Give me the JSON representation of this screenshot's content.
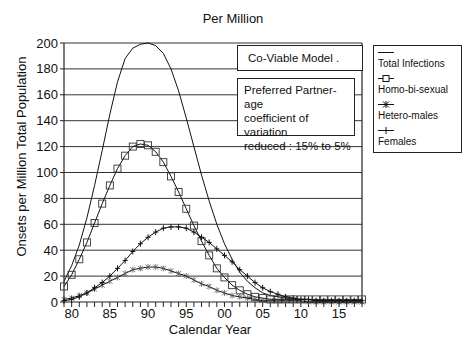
{
  "chart": {
    "title": "Per Million",
    "ylabel": "Onsets per Million Total Population",
    "xlabel": "Calendar Year",
    "notes": {
      "model": "Co-Viable Model .",
      "line1": "Preferred Partner-age",
      "line2": "coefficient of variation",
      "line3": "reduced  : 15% to 5%"
    },
    "legend": [
      {
        "label": "Total Infections",
        "marker": "none"
      },
      {
        "label": "Homo-bi-sexual",
        "marker": "square"
      },
      {
        "label": "Hetero-males",
        "marker": "asterisk"
      },
      {
        "label": "Females",
        "marker": "plus"
      }
    ],
    "yticks": [
      "0",
      "20",
      "40",
      "60",
      "80",
      "100",
      "120",
      "140",
      "160",
      "180",
      "200"
    ],
    "xticks": [
      "80",
      "85",
      "90",
      "95",
      "00",
      "05",
      "10",
      "15"
    ]
  },
  "chart_data": {
    "type": "line",
    "title": "Per Million",
    "xlabel": "Calendar Year",
    "ylabel": "Onsets per Million Total Population",
    "xlim": [
      1979,
      2018
    ],
    "ylim": [
      0,
      200
    ],
    "grid": "horizontal",
    "legend_position": "right-outside",
    "x": [
      1979,
      1980,
      1981,
      1982,
      1983,
      1984,
      1985,
      1986,
      1987,
      1988,
      1989,
      1990,
      1991,
      1992,
      1993,
      1994,
      1995,
      1996,
      1997,
      1998,
      1999,
      2000,
      2001,
      2002,
      2003,
      2004,
      2005,
      2006,
      2007,
      2008,
      2009,
      2010,
      2011,
      2012,
      2013,
      2014,
      2015,
      2016,
      2017,
      2018
    ],
    "series": [
      {
        "name": "Total Infections",
        "values": [
          16,
          28,
          44,
          65,
          90,
          117,
          145,
          170,
          188,
          196,
          199,
          200,
          198,
          192,
          180,
          163,
          142,
          120,
          98,
          78,
          60,
          45,
          33,
          23,
          16,
          11,
          7,
          5,
          4,
          3,
          2,
          2,
          2,
          1,
          1,
          1,
          1,
          1,
          1,
          1
        ]
      },
      {
        "name": "Homo-bi-sexual",
        "values": [
          12,
          21,
          33,
          46,
          61,
          76,
          90,
          103,
          113,
          120,
          122,
          121,
          116,
          108,
          97,
          85,
          72,
          59,
          47,
          36,
          26,
          19,
          13,
          9,
          6,
          4,
          3,
          2,
          2,
          2,
          2,
          2,
          2,
          2,
          2,
          2,
          2,
          2,
          2,
          2
        ]
      },
      {
        "name": "Hetero-males",
        "values": [
          2,
          3,
          5,
          7,
          10,
          13,
          16,
          19,
          22,
          25,
          26,
          27,
          27,
          26,
          24,
          22,
          20,
          17,
          14,
          12,
          9,
          7,
          5,
          4,
          3,
          2,
          1,
          1,
          1,
          1,
          1,
          1,
          0,
          0,
          0,
          0,
          0,
          0,
          0,
          0
        ]
      },
      {
        "name": "Females",
        "values": [
          1,
          2,
          4,
          7,
          11,
          15,
          20,
          26,
          32,
          39,
          45,
          50,
          54,
          57,
          58,
          58,
          57,
          54,
          50,
          46,
          41,
          36,
          31,
          25,
          20,
          15,
          11,
          8,
          6,
          4,
          3,
          2,
          2,
          1,
          1,
          1,
          1,
          1,
          1,
          1
        ]
      }
    ]
  }
}
